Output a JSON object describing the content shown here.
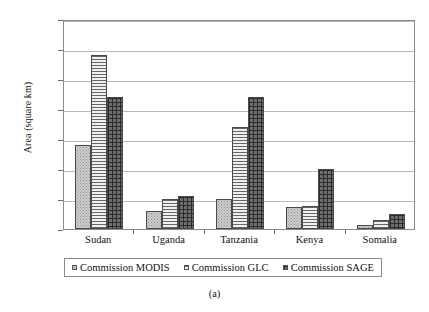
{
  "caption": "(a)",
  "chart_data": {
    "type": "bar",
    "title": "",
    "subtitle": "",
    "xlabel": "",
    "ylabel": "Area (square km)",
    "ylim": [
      0,
      70000
    ],
    "ytick_values": [
      0,
      10000,
      20000,
      30000,
      40000,
      50000,
      60000,
      70000
    ],
    "ytick_labels": [
      "0",
      "10000",
      "20000",
      "30000",
      "40000",
      "50000",
      "60000",
      "70000"
    ],
    "grid": true,
    "legend_position": "bottom",
    "categories": [
      "Sudan",
      "Uganda",
      "Tanzania",
      "Kenya",
      "Somalia"
    ],
    "series": [
      {
        "name": "Commission MODIS",
        "pattern": "light-dotted",
        "color": "#cfcfcf",
        "values": [
          28000,
          6000,
          10000,
          7500,
          1500
        ]
      },
      {
        "name": "Commission GLC",
        "pattern": "horizontal-lines",
        "color": "#f0f0f0",
        "values": [
          58000,
          10000,
          34000,
          7800,
          3000
        ]
      },
      {
        "name": "Commission SAGE",
        "pattern": "dark-crosshatch",
        "color": "#6f6f6f",
        "values": [
          44000,
          11000,
          44000,
          20000,
          5000
        ]
      }
    ]
  }
}
